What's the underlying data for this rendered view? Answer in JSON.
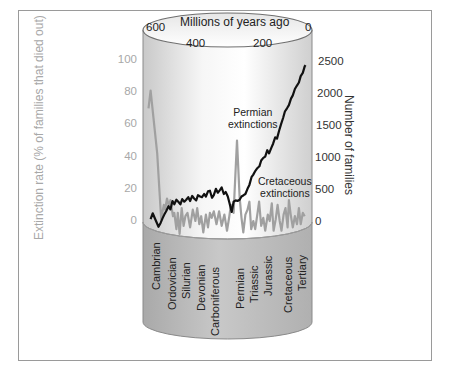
{
  "chart_data": {
    "type": "line",
    "title": "",
    "xlabel": "Millions of years ago",
    "ylabel": "Extinction rate (% of families that died out)",
    "ylabel_right": "Number of families",
    "x_ticks": [
      "600",
      "400",
      "200",
      "0"
    ],
    "y_left_ticks": [
      "100",
      "80",
      "60",
      "40",
      "20",
      "0"
    ],
    "y_right_ticks": [
      "2500",
      "2000",
      "1500",
      "1000",
      "500",
      "0"
    ],
    "xlim": [
      600,
      0
    ],
    "ylim_left": [
      0,
      100
    ],
    "ylim_right": [
      0,
      2500
    ],
    "grid": false,
    "series": [
      {
        "name": "Extinction rate",
        "axis": "left",
        "color": "#a0a0a0",
        "x": [
          598,
          590,
          565,
          555,
          550,
          540,
          535,
          528,
          520,
          515,
          505,
          500,
          492,
          487,
          480,
          472,
          465,
          458,
          450,
          440,
          430,
          420,
          413,
          405,
          398,
          390,
          380,
          372,
          365,
          358,
          350,
          340,
          330,
          320,
          310,
          300,
          292,
          285,
          275,
          262,
          252,
          245,
          238,
          230,
          222,
          215,
          208,
          200,
          193,
          185,
          178,
          170,
          162,
          155,
          145,
          138,
          130,
          123,
          115,
          108,
          100,
          93,
          85,
          78,
          70,
          65,
          58,
          50,
          42,
          34,
          27,
          20,
          12,
          5
        ],
        "values": [
          70,
          81,
          42,
          15,
          1,
          10,
          7,
          14,
          9,
          13,
          3,
          5,
          -5,
          5,
          -8,
          8,
          -3,
          3,
          5,
          -4,
          7,
          0,
          8,
          -2,
          3,
          -7,
          4,
          -4,
          5,
          2,
          6,
          -2,
          6,
          -3,
          4,
          -6,
          2,
          10,
          5,
          50,
          15,
          2,
          -7,
          4,
          7,
          12,
          -5,
          0,
          -5,
          4,
          12,
          -3,
          2,
          -6,
          4,
          0,
          11,
          -6,
          1,
          10,
          0,
          -6,
          4,
          8,
          -4,
          13,
          4,
          -4,
          3,
          -2,
          8,
          -2,
          5,
          3
        ]
      },
      {
        "name": "Number of families",
        "axis": "right",
        "color": "#111111",
        "x": [
          590,
          582,
          570,
          560,
          552,
          545,
          538,
          530,
          522,
          515,
          507,
          500,
          492,
          485,
          477,
          470,
          462,
          455,
          447,
          440,
          432,
          425,
          417,
          410,
          402,
          395,
          387,
          380,
          372,
          365,
          357,
          350,
          342,
          335,
          327,
          320,
          312,
          305,
          297,
          290,
          282,
          275,
          267,
          260,
          252,
          245,
          237,
          230,
          222,
          215,
          207,
          200,
          192,
          185,
          177,
          170,
          162,
          155,
          147,
          140,
          132,
          125,
          117,
          110,
          102,
          95,
          87,
          80,
          72,
          65,
          57,
          50,
          42,
          35,
          27,
          20,
          12,
          5,
          2
        ],
        "values": [
          30,
          120,
          5,
          -90,
          -30,
          40,
          100,
          160,
          230,
          180,
          310,
          260,
          330,
          300,
          260,
          340,
          300,
          330,
          370,
          310,
          390,
          350,
          320,
          400,
          380,
          370,
          420,
          380,
          460,
          470,
          360,
          400,
          500,
          440,
          480,
          520,
          420,
          450,
          380,
          270,
          140,
          300,
          320,
          310,
          330,
          380,
          400,
          420,
          500,
          560,
          680,
          720,
          780,
          820,
          850,
          940,
          980,
          1000,
          1100,
          1050,
          1130,
          1200,
          1300,
          1280,
          1400,
          1500,
          1600,
          1700,
          1750,
          1800,
          1900,
          1950,
          2050,
          2100,
          2150,
          2250,
          2300,
          2400,
          2420
        ]
      }
    ],
    "annotations": [
      {
        "text": "Permian extinctions",
        "x": 250,
        "y_left": 70
      },
      {
        "text": "Cretaceous extinctions",
        "x": 65,
        "y_left": 25
      }
    ],
    "periods": [
      "Cambrian",
      "Ordovician",
      "Silurian",
      "Devonian",
      "Carboniferous",
      "Permian",
      "Triassic",
      "Jurassic",
      "Cretaceous",
      "Tertiary"
    ]
  },
  "labels": {
    "xlabel": "Millions of years ago",
    "ylabel_left": "Extinction rate (% of families that died out)",
    "ylabel_right": "Number of families",
    "x_ticks": [
      "600",
      "400",
      "200",
      "0"
    ],
    "y_left": [
      "100",
      "80",
      "60",
      "40",
      "20",
      "0"
    ],
    "y_right": [
      "2500",
      "2000",
      "1500",
      "1000",
      "500",
      "0"
    ],
    "permian_1": "Permian",
    "permian_2": "extinctions",
    "cretaceous_1": "Cretaceous",
    "cretaceous_2": "extinctions",
    "periods": [
      "Cambrian",
      "Ordovician",
      "Silurian",
      "Devonian",
      "Carboniferous",
      "Permian",
      "Triassic",
      "Jurassic",
      "Cretaceous",
      "Tertiary"
    ]
  }
}
